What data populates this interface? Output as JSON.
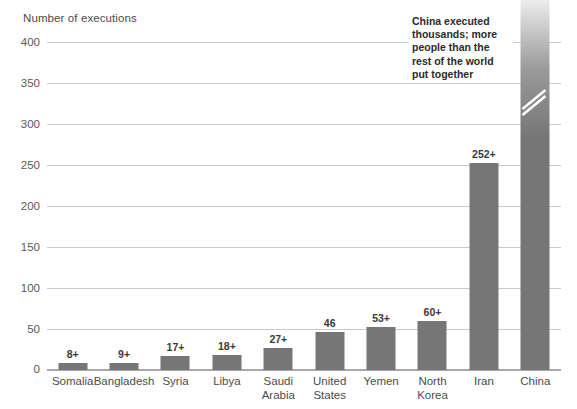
{
  "chart_data": {
    "type": "bar",
    "title": "Number of executions",
    "xlabel": "",
    "ylabel": "Number of executions",
    "ylim": [
      0,
      400
    ],
    "yticks": [
      0,
      50,
      100,
      150,
      200,
      250,
      300,
      350,
      400
    ],
    "grid": true,
    "legend": "none",
    "categories": [
      "Somalia",
      "Bangladesh",
      "Syria",
      "Libya",
      "Saudi Arabia",
      "United States",
      "Yemen",
      "North Korea",
      "Iran",
      "China"
    ],
    "values": [
      8,
      9,
      17,
      18,
      27,
      46,
      53,
      60,
      252,
      400
    ],
    "value_labels": [
      "8+",
      "9+",
      "17+",
      "18+",
      "27+",
      "46",
      "53+",
      "60+",
      "252+",
      ""
    ],
    "annotations": [
      {
        "text": "China executed thousands; more people than the rest of the world put together",
        "target": "China"
      }
    ],
    "colors": {
      "bar": "#767676",
      "gridline": "#c9c9c9",
      "baseline": "#a9a9a9",
      "text": "#4c4c4c",
      "annotation_text": "#2b2b2b",
      "background": "#ffffff"
    }
  },
  "bars": [
    {
      "label_line1": "Somalia",
      "label_line2": "",
      "value_label": "8+"
    },
    {
      "label_line1": "Bangladesh",
      "label_line2": "",
      "value_label": "9+"
    },
    {
      "label_line1": "Syria",
      "label_line2": "",
      "value_label": "17+"
    },
    {
      "label_line1": "Libya",
      "label_line2": "",
      "value_label": "18+"
    },
    {
      "label_line1": "Saudi",
      "label_line2": "Arabia",
      "value_label": "27+"
    },
    {
      "label_line1": "United",
      "label_line2": "States",
      "value_label": "46"
    },
    {
      "label_line1": "Yemen",
      "label_line2": "",
      "value_label": "53+"
    },
    {
      "label_line1": "North",
      "label_line2": "Korea",
      "value_label": "60+"
    },
    {
      "label_line1": "Iran",
      "label_line2": "",
      "value_label": "252+"
    },
    {
      "label_line1": "China",
      "label_line2": "",
      "value_label": ""
    }
  ],
  "yticks": [
    {
      "label": "400"
    },
    {
      "label": "350"
    },
    {
      "label": "300"
    },
    {
      "label": "250"
    },
    {
      "label": "200"
    },
    {
      "label": "150"
    },
    {
      "label": "100"
    },
    {
      "label": "50"
    },
    {
      "label": "0"
    }
  ],
  "annotation": {
    "text": "China executed thousands; more people than the rest of the world put together"
  }
}
